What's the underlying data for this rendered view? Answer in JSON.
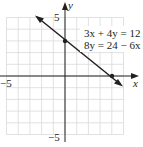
{
  "chart_data": {
    "type": "line",
    "title": "",
    "xlabel": "x",
    "ylabel": "y",
    "xlim": [
      -5.5,
      5.5
    ],
    "ylim": [
      -5.5,
      5.5
    ],
    "grid": true,
    "tick_labels": {
      "x_neg": "−5",
      "y_pos": "5",
      "y_neg": "−5"
    },
    "equations": [
      "3x + 4y = 12",
      "8y = 24 − 6x"
    ],
    "series": [
      {
        "name": "3x + 4y = 12",
        "x": [
          -2.6,
          0,
          4,
          4.6
        ],
        "y": [
          5.0,
          3,
          0,
          -0.45
        ]
      }
    ],
    "points": [
      {
        "x": 0,
        "y": 3,
        "label": "y-intercept"
      },
      {
        "x": 4,
        "y": 0,
        "label": "x-intercept"
      }
    ]
  }
}
